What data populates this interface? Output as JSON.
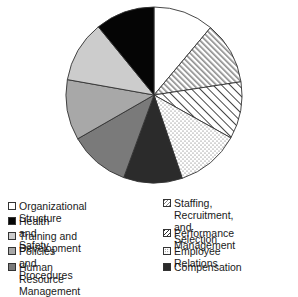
{
  "chart_data": {
    "type": "pie",
    "title": "",
    "start_angle_deg": 0,
    "direction": "clockwise",
    "categories": [
      "Organizational Structure",
      "Staffing, Recruitment, and Selection",
      "Performance Management",
      "Employee Relations",
      "Compensation",
      "Human Resource Management",
      "Policies and Procedures",
      "Training and Development",
      "Health and Safety"
    ],
    "values": [
      11.1,
      11.5,
      10.5,
      11.7,
      10.8,
      11.1,
      11.1,
      11.3,
      10.9
    ],
    "unit": "percent (estimated from angles)",
    "legend_position": "bottom",
    "fills": [
      {
        "category": "Organizational Structure",
        "pattern": "solid",
        "color": "#ffffff"
      },
      {
        "category": "Staffing, Recruitment, and Selection",
        "pattern": "dense-diagonal-hatch",
        "color": "#888888"
      },
      {
        "category": "Performance Management",
        "pattern": "diagonal-hatch",
        "color": "#333333"
      },
      {
        "category": "Employee Relations",
        "pattern": "dots",
        "color": "#555555"
      },
      {
        "category": "Compensation",
        "pattern": "solid",
        "color": "#2b2b2b"
      },
      {
        "category": "Human Resource Management",
        "pattern": "solid",
        "color": "#7a7a7a"
      },
      {
        "category": "Policies and Procedures",
        "pattern": "solid",
        "color": "#a8a8a8"
      },
      {
        "category": "Training and Development",
        "pattern": "solid",
        "color": "#cccccc"
      },
      {
        "category": "Health and Safety",
        "pattern": "solid",
        "color": "#050505"
      }
    ]
  },
  "legend": {
    "left": [
      {
        "label": "Organizational Structure",
        "swatch": "white"
      },
      {
        "label": "Health and Safety",
        "swatch": "black"
      },
      {
        "label": "Training and Development",
        "swatch": "light-gray"
      },
      {
        "label": "Policies and Procedures",
        "swatch": "gray"
      },
      {
        "label": "Human Resource Management",
        "swatch": "dark-gray"
      }
    ],
    "right": [
      {
        "label": "Staffing, Recruitment,\nand Selection",
        "swatch": "dense-hatch"
      },
      {
        "label": "Performance Management",
        "swatch": "hatch"
      },
      {
        "label": "Employee Relations",
        "swatch": "dots"
      },
      {
        "label": "Compensation",
        "swatch": "very-dark"
      }
    ]
  }
}
